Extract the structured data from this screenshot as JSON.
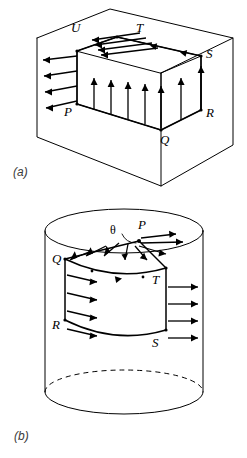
{
  "figure": {
    "background_color": "#ffffff",
    "line_color": "#000000",
    "caption_color": "#3b3b3b",
    "panels": [
      {
        "id": "a",
        "caption": "(a)",
        "shape": "cube",
        "description": "Rectangular block with a rectangular circulation loop drawn on two adjacent faces, with field arrows.",
        "vertex_labels": [
          "U",
          "T",
          "S",
          "P",
          "R",
          "Q"
        ],
        "loop_path": "P-U-T-S-R-Q-P",
        "arrow_groups": [
          {
            "name": "top-face-arrows",
            "direction": "left",
            "count": 4
          },
          {
            "name": "upper-left-face-arrows",
            "direction": "left",
            "count": 4
          },
          {
            "name": "front-face-arrows",
            "direction": "up",
            "count": 7
          }
        ]
      },
      {
        "id": "b",
        "caption": "(b)",
        "shape": "cylinder",
        "description": "Upright cylinder with a loop on the top disc and curved side surface, with radial and tangential field arrows.",
        "vertex_labels": [
          "P",
          "Q",
          "T",
          "R",
          "S"
        ],
        "angle_label": "θ",
        "loop_path": "P-Q-R-S-T-P",
        "arrow_groups": [
          {
            "name": "top-disc-radial-arrows",
            "direction": "outward-from-P",
            "count": 8
          },
          {
            "name": "side-surface-arrows",
            "direction": "right",
            "count": 8
          }
        ],
        "hidden_edge_style": "dashed"
      }
    ],
    "labels": {
      "a": {
        "U": "U",
        "T": "T",
        "S": "S",
        "P": "P",
        "R": "R",
        "Q": "Q"
      },
      "b": {
        "theta": "θ",
        "P": "P",
        "Q": "Q",
        "T": "T",
        "R": "R",
        "S": "S"
      }
    },
    "captions": {
      "a": "(a)",
      "b": "(b)"
    }
  }
}
